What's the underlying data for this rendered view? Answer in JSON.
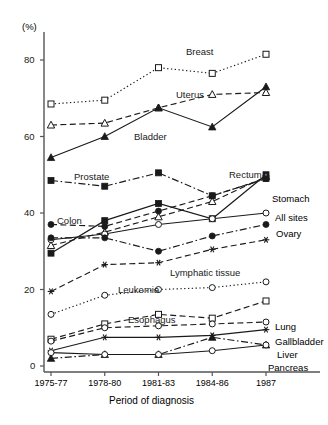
{
  "chart_data": {
    "type": "line",
    "title": "",
    "xlabel": "Period of diagnosis",
    "ylabel": "(%)",
    "ylim": [
      0,
      90
    ],
    "yticks": [
      0,
      20,
      40,
      60,
      80
    ],
    "categories": [
      "1975-77",
      "1978-80",
      "1981-83",
      "1984-86",
      "1987"
    ],
    "grid": false,
    "legend_position": "inline-labels",
    "series": [
      {
        "name": "Breast",
        "values": [
          68.5,
          69.5,
          78.0,
          76.5,
          81.5
        ],
        "marker": "open-square",
        "line": "dotted",
        "label_pos": "inline"
      },
      {
        "name": "Uterus",
        "values": [
          63.0,
          63.5,
          67.5,
          71.0,
          71.5
        ],
        "marker": "open-triangle",
        "line": "dashed",
        "label_pos": "inline"
      },
      {
        "name": "Bladder",
        "values": [
          54.5,
          60.0,
          67.5,
          62.5,
          73.0
        ],
        "marker": "filled-triangle",
        "line": "solid",
        "label_pos": "inline"
      },
      {
        "name": "Prostate",
        "values": [
          48.5,
          47.0,
          50.5,
          44.5,
          49.0
        ],
        "marker": "filled-square",
        "line": "dash-dot",
        "label_pos": "inline"
      },
      {
        "name": "Rectum",
        "values": [
          29.5,
          38.0,
          42.5,
          38.5,
          50.0
        ],
        "marker": "filled-square",
        "line": "solid",
        "label_pos": "inline"
      },
      {
        "name": "Stomach",
        "values": [
          31.5,
          35.0,
          39.0,
          43.0,
          49.5
        ],
        "marker": "open-triangle",
        "line": "dashed",
        "label_pos": "right"
      },
      {
        "name": "All sites",
        "values": [
          33.0,
          34.5,
          37.0,
          38.5,
          40.0
        ],
        "marker": "open-circle",
        "line": "solid",
        "label_pos": "right"
      },
      {
        "name": "Colon",
        "values": [
          37.0,
          36.5,
          40.5,
          44.5,
          49.0
        ],
        "marker": "filled-circle",
        "line": "dashed",
        "label_pos": "inline"
      },
      {
        "name": "Ovary",
        "values": [
          33.5,
          33.5,
          30.0,
          34.0,
          37.0
        ],
        "marker": "filled-circle",
        "line": "dash-dot",
        "label_pos": "right"
      },
      {
        "name": "Lymphatic tissue",
        "values": [
          19.5,
          26.5,
          27.0,
          30.5,
          33.0
        ],
        "marker": "asterisk",
        "line": "dashed",
        "label_pos": "inline"
      },
      {
        "name": "Leukemia",
        "values": [
          13.5,
          18.5,
          20.0,
          20.5,
          22.0
        ],
        "marker": "open-circle",
        "line": "dotted",
        "label_pos": "inline"
      },
      {
        "name": "Esophagus",
        "values": [
          7.0,
          11.0,
          13.5,
          12.5,
          17.0
        ],
        "marker": "open-square",
        "line": "dashed",
        "label_pos": "inline"
      },
      {
        "name": "Lung",
        "values": [
          6.5,
          10.0,
          10.5,
          11.0,
          11.5
        ],
        "marker": "open-circle",
        "line": "dashed",
        "label_pos": "right"
      },
      {
        "name": "Gallbladder",
        "values": [
          4.0,
          7.5,
          7.5,
          8.0,
          9.5
        ],
        "marker": "asterisk",
        "line": "solid",
        "label_pos": "right"
      },
      {
        "name": "Liver",
        "values": [
          2.0,
          3.0,
          3.0,
          7.5,
          5.5
        ],
        "marker": "filled-triangle",
        "line": "dash-dot",
        "label_pos": "right"
      },
      {
        "name": "Pancreas",
        "values": [
          3.5,
          3.0,
          3.0,
          4.0,
          5.5
        ],
        "marker": "open-circle",
        "line": "solid",
        "label_pos": "right"
      }
    ],
    "inline_labels": [
      {
        "text": "Breast",
        "x": 186,
        "y": 47
      },
      {
        "text": "Uterus",
        "x": 176,
        "y": 90
      },
      {
        "text": "Bladder",
        "x": 134,
        "y": 132
      },
      {
        "text": "Prostate",
        "x": 74,
        "y": 172
      },
      {
        "text": "Rectum",
        "x": 229,
        "y": 170
      },
      {
        "text": "Colon",
        "x": 57,
        "y": 216
      },
      {
        "text": "Lymphatic tissue",
        "x": 170,
        "y": 268
      },
      {
        "text": "Leukemia",
        "x": 118,
        "y": 285
      },
      {
        "text": "Esophagus",
        "x": 128,
        "y": 315
      }
    ],
    "right_labels": [
      {
        "text": "Stomach",
        "x": 272,
        "y": 194
      },
      {
        "text": "All sites",
        "x": 275,
        "y": 213
      },
      {
        "text": "Ovary",
        "x": 276,
        "y": 229
      },
      {
        "text": "Lung",
        "x": 275,
        "y": 322
      },
      {
        "text": "Gallbladder",
        "x": 275,
        "y": 337
      },
      {
        "text": "Liver",
        "x": 277,
        "y": 350
      },
      {
        "text": "Pancreas",
        "x": 268,
        "y": 363
      }
    ],
    "ytick_labels": [
      "0",
      "20",
      "40",
      "60",
      "80"
    ],
    "axis_unit_label": "(%)"
  },
  "colors": {
    "ink": "#1a1a1a",
    "axis": "#555555",
    "background": "#ffffff"
  }
}
